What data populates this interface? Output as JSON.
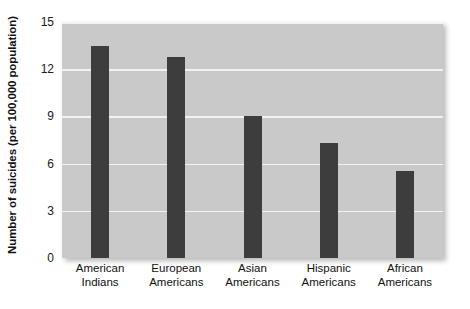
{
  "chart_data": {
    "type": "bar",
    "title": "",
    "subtitle": "",
    "xlabel": "",
    "ylabel": "Number of suicides (per 100,000 population)",
    "categories": [
      "American Indians",
      "European Americans",
      "Asian Americans",
      "Hispanic Americans",
      "African Americans"
    ],
    "category_lines": [
      [
        "American",
        "Indians"
      ],
      [
        "European",
        "Americans"
      ],
      [
        "Asian",
        "Americans"
      ],
      [
        "Hispanic",
        "Americans"
      ],
      [
        "African",
        "Americans"
      ]
    ],
    "values": [
      13.5,
      12.8,
      9.0,
      7.3,
      5.5
    ],
    "ylim": [
      0,
      15
    ],
    "yticks": [
      0,
      3,
      6,
      9,
      12,
      15
    ],
    "ytick_labels": [
      "0",
      "3",
      "6",
      "9",
      "12",
      "15"
    ],
    "grid": true,
    "grid_orientation": "horizontal",
    "legend": false,
    "legend_position": "none",
    "annotations": []
  },
  "style": {
    "bar_color": "#3d3d3d",
    "plot_background": "#c9c9c9",
    "gridline_color": "#f2f2f2",
    "figure_background": "#ffffff",
    "text_color": "#111111"
  }
}
